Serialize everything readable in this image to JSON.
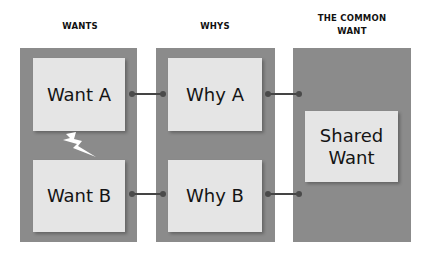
{
  "diagram": {
    "columns": [
      {
        "heading": "WANTS",
        "boxes": [
          "Want A",
          "Want B"
        ]
      },
      {
        "heading": "WHYS",
        "boxes": [
          "Why A",
          "Why B"
        ]
      },
      {
        "heading_line1": "THE COMMON",
        "heading_line2": "WANT",
        "boxes": [
          "Shared Want"
        ]
      }
    ],
    "shared_box_line1": "Shared",
    "shared_box_line2": "Want",
    "conflict_icon": "lightning-bolt-icon",
    "connectors": [
      {
        "from": "Want A",
        "to": "Why A"
      },
      {
        "from": "Want B",
        "to": "Why B"
      },
      {
        "from": "Why A",
        "to": "Shared Want"
      },
      {
        "from": "Why B",
        "to": "Shared Want"
      }
    ],
    "colors": {
      "panel": "#8b8b8b",
      "box": "#e5e5e5",
      "connector": "#444444",
      "text": "#141414"
    }
  }
}
